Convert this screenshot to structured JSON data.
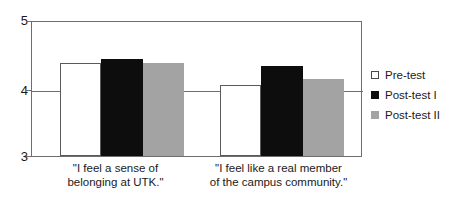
{
  "chart_data": {
    "type": "bar",
    "title": "",
    "xlabel": "",
    "ylabel": "",
    "ylim": [
      3,
      5
    ],
    "yticks": [
      "3",
      "4",
      "5"
    ],
    "grid": true,
    "legend_position": "right",
    "categories": [
      "\"I feel a sense of belonging at UTK.\"",
      "\"I feel like a real member of the campus community.\""
    ],
    "category_lines": [
      [
        "\"I feel a sense of",
        "belonging at UTK.\""
      ],
      [
        "\"I feel like a real member",
        "of the campus community.\""
      ]
    ],
    "series": [
      {
        "name": "Pre-test",
        "color": "#ffffff",
        "values": [
          4.37,
          4.05
        ]
      },
      {
        "name": "Post-test I",
        "color": "#0d0d0d",
        "values": [
          4.42,
          4.33
        ]
      },
      {
        "name": "Post-test II",
        "color": "#a3a3a3",
        "values": [
          4.37,
          4.13
        ]
      }
    ]
  },
  "legend": {
    "items": [
      {
        "label": "Pre-test"
      },
      {
        "label": "Post-test I"
      },
      {
        "label": "Post-test II"
      }
    ]
  },
  "axis": {
    "y": {
      "tick_top": "5",
      "tick_mid": "4",
      "tick_bottom": "3"
    }
  }
}
